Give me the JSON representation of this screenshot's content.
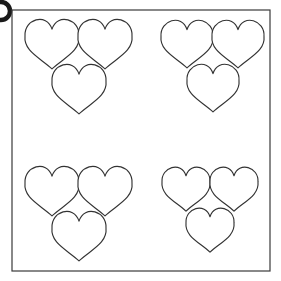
{
  "figure": {
    "background_color": "#ffffff",
    "width": 281,
    "height": 281,
    "total_shape_count": 12,
    "shape_kind": "heart",
    "shape_fill": "#ffffff",
    "shape_stroke": "#333333"
  },
  "frame": {
    "name": "outer-border",
    "stroke_color": "#3a3a3a",
    "x": 12,
    "y": 10,
    "width": 258,
    "height": 261
  },
  "edge_marker": {
    "name": "clipped-ring",
    "stroke_color": "#1a1a1a",
    "cx": 1,
    "cy": 11,
    "r": 9
  },
  "groups": [
    {
      "id": "top-left",
      "label": "Top Left Group",
      "count": 3,
      "heart_size": 54,
      "hearts": [
        {
          "cx": 52,
          "cy": 44,
          "size": 54
        },
        {
          "cx": 105,
          "cy": 44,
          "size": 54
        },
        {
          "cx": 79,
          "cy": 89,
          "size": 54
        }
      ]
    },
    {
      "id": "top-right",
      "label": "Top Right Group",
      "count": 3,
      "heart_size": 52,
      "hearts": [
        {
          "cx": 187,
          "cy": 44,
          "size": 52
        },
        {
          "cx": 238,
          "cy": 44,
          "size": 52
        },
        {
          "cx": 213,
          "cy": 88,
          "size": 52
        }
      ]
    },
    {
      "id": "bottom-left",
      "label": "Bottom Left Group",
      "count": 3,
      "heart_size": 54,
      "hearts": [
        {
          "cx": 52,
          "cy": 191,
          "size": 54
        },
        {
          "cx": 105,
          "cy": 191,
          "size": 54
        },
        {
          "cx": 79,
          "cy": 236,
          "size": 54
        }
      ]
    },
    {
      "id": "bottom-right",
      "label": "Bottom Right Group",
      "count": 3,
      "heart_size": 48,
      "hearts": [
        {
          "cx": 186,
          "cy": 189,
          "size": 48
        },
        {
          "cx": 234,
          "cy": 189,
          "size": 48
        },
        {
          "cx": 210,
          "cy": 230,
          "size": 48
        }
      ]
    }
  ]
}
